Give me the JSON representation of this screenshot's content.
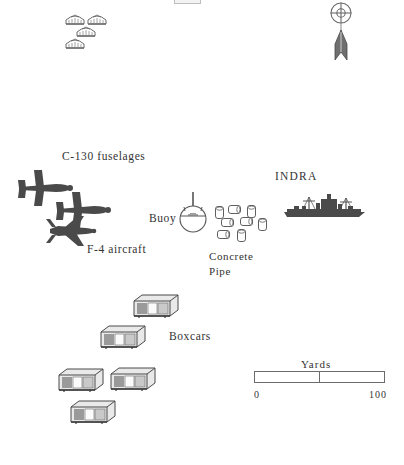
{
  "figure": {
    "kind": "site-plan-map",
    "background_color": "#ffffff",
    "ink_color": "#333333",
    "symbol_fill": "#4a4a4a"
  },
  "labels": {
    "c130": "C-130 fuselages",
    "f4": "F-4 aircraft",
    "buoy": "Buoy",
    "concrete_pipe_line1": "Concrete",
    "concrete_pipe_line2": "Pipe",
    "indra": "INDRA",
    "boxcars": "Boxcars"
  },
  "scale": {
    "title": "Yards",
    "min_label": "0",
    "max_label": "100",
    "ticks": [
      "0",
      "100"
    ],
    "midpoint_tick": true,
    "units": "Yards",
    "bar_left_px": 254,
    "bar_right_px": 385
  },
  "north_arrow": {
    "name": "north-arrow",
    "style": "crosshair-circle-with-dart"
  },
  "features": {
    "revetments": {
      "label": "revetment-dome",
      "count": 4,
      "positions": [
        {
          "x": 66,
          "y": 14
        },
        {
          "x": 88,
          "y": 14
        },
        {
          "x": 77,
          "y": 26
        },
        {
          "x": 66,
          "y": 38
        }
      ]
    },
    "c130_fuselages": {
      "count": 2,
      "positions": [
        {
          "x": 20,
          "y": 170
        },
        {
          "x": 58,
          "y": 190
        }
      ]
    },
    "f4_aircraft": {
      "count": 1,
      "positions": [
        {
          "x": 48,
          "y": 216
        }
      ]
    },
    "buoy": {
      "count": 1,
      "positions": [
        {
          "x": 180,
          "y": 194
        }
      ]
    },
    "concrete_pipes": {
      "count": 8,
      "positions": [
        {
          "x": 218,
          "y": 212,
          "r": 0
        },
        {
          "x": 232,
          "y": 207,
          "r": 90
        },
        {
          "x": 250,
          "y": 209,
          "r": 0
        },
        {
          "x": 226,
          "y": 222,
          "r": 90
        },
        {
          "x": 245,
          "y": 221,
          "r": 90
        },
        {
          "x": 261,
          "y": 222,
          "r": 0
        },
        {
          "x": 222,
          "y": 234,
          "r": 90
        },
        {
          "x": 240,
          "y": 233,
          "r": 0
        }
      ]
    },
    "ship_indra": {
      "count": 1,
      "positions": [
        {
          "x": 282,
          "y": 196
        }
      ]
    },
    "boxcars": {
      "count": 5,
      "positions": [
        {
          "x": 133,
          "y": 293
        },
        {
          "x": 100,
          "y": 324
        },
        {
          "x": 60,
          "y": 367
        },
        {
          "x": 112,
          "y": 366
        },
        {
          "x": 72,
          "y": 399
        }
      ]
    }
  }
}
